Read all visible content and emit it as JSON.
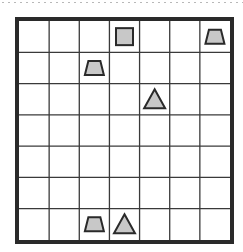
{
  "puzzle": {
    "rows": 7,
    "cols": 7,
    "fill_color": "#c8c8c8",
    "stroke_color": "#2a2a2a",
    "shapes": [
      {
        "type": "square",
        "row": 0,
        "col": 3
      },
      {
        "type": "trapezoid",
        "row": 0,
        "col": 6
      },
      {
        "type": "trapezoid",
        "row": 1,
        "col": 2
      },
      {
        "type": "triangle",
        "row": 2,
        "col": 4
      },
      {
        "type": "trapezoid",
        "row": 6,
        "col": 2
      },
      {
        "type": "triangle",
        "row": 6,
        "col": 3
      }
    ]
  }
}
